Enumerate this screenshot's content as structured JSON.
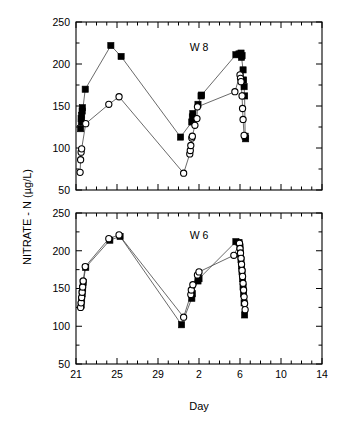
{
  "figure": {
    "yaxis_title": "NITRATE - N (µg/L)",
    "xaxis_title": "Day"
  },
  "chart_data": [
    {
      "type": "line",
      "panel_id": "top",
      "title": "W 8",
      "xlabel": "",
      "ylabel": "NITRATE - N (µg/L)",
      "xlim": [
        21,
        14
      ],
      "ylim": [
        50,
        250
      ],
      "yticks": [
        50,
        100,
        150,
        200,
        250
      ],
      "xticks": [
        21,
        25,
        29,
        2,
        6,
        10,
        14
      ],
      "xtick_minor_step": 1,
      "grid": false,
      "legend": "none",
      "series": [
        {
          "name": "filled-squares",
          "marker": "filled-square",
          "points": [
            [
              21.45,
              123
            ],
            [
              21.5,
              135
            ],
            [
              21.55,
              139
            ],
            [
              21.6,
              144
            ],
            [
              21.62,
              148
            ],
            [
              21.52,
              131
            ],
            [
              21.9,
              170
            ],
            [
              24.4,
              222
            ],
            [
              25.4,
              209
            ],
            [
              31.2,
              113
            ],
            [
              32.3,
              131
            ],
            [
              32.35,
              137
            ],
            [
              32.4,
              141
            ],
            [
              32.9,
              152
            ],
            [
              33.2,
              162
            ],
            [
              33.25,
              163
            ],
            [
              36.6,
              211
            ],
            [
              36.9,
              212
            ],
            [
              37.1,
              213
            ],
            [
              37.2,
              210
            ],
            [
              37.15,
              208
            ],
            [
              37.3,
              193
            ],
            [
              37.35,
              181
            ],
            [
              37.4,
              173
            ],
            [
              37.45,
              162
            ],
            [
              37.5,
              114
            ],
            [
              37.55,
              111
            ]
          ]
        },
        {
          "name": "open-circles",
          "marker": "open-circle",
          "points": [
            [
              21.4,
              71
            ],
            [
              21.45,
              86
            ],
            [
              21.5,
              95
            ],
            [
              21.55,
              99
            ],
            [
              21.95,
              129
            ],
            [
              24.2,
              152
            ],
            [
              25.2,
              161
            ],
            [
              31.5,
              70
            ],
            [
              32.1,
              93
            ],
            [
              32.15,
              97
            ],
            [
              32.2,
              103
            ],
            [
              32.3,
              112
            ],
            [
              32.35,
              114
            ],
            [
              32.6,
              127
            ],
            [
              32.8,
              135
            ],
            [
              32.85,
              149
            ],
            [
              36.5,
              167
            ],
            [
              37.0,
              187
            ],
            [
              37.05,
              183
            ],
            [
              37.1,
              179
            ],
            [
              37.2,
              162
            ],
            [
              37.25,
              147
            ],
            [
              37.3,
              134
            ],
            [
              37.4,
              115
            ]
          ]
        }
      ]
    },
    {
      "type": "line",
      "panel_id": "bottom",
      "title": "W 6",
      "xlabel": "Day",
      "ylabel": "NITRATE - N (µg/L)",
      "xlim": [
        21,
        14
      ],
      "ylim": [
        50,
        250
      ],
      "yticks": [
        50,
        100,
        150,
        200,
        250
      ],
      "xticks": [
        21,
        25,
        29,
        2,
        6,
        10,
        14
      ],
      "xtick_minor_step": 1,
      "grid": false,
      "legend": "none",
      "series": [
        {
          "name": "filled-squares",
          "marker": "filled-square",
          "points": [
            [
              21.5,
              128
            ],
            [
              21.55,
              135
            ],
            [
              21.6,
              143
            ],
            [
              21.65,
              150
            ],
            [
              21.7,
              158
            ],
            [
              21.95,
              178
            ],
            [
              24.3,
              214
            ],
            [
              25.3,
              219
            ],
            [
              31.3,
              102
            ],
            [
              32.3,
              137
            ],
            [
              32.35,
              143
            ],
            [
              32.9,
              160
            ],
            [
              33.0,
              163
            ],
            [
              36.6,
              212
            ],
            [
              36.9,
              211
            ],
            [
              37.0,
              205
            ],
            [
              37.05,
              196
            ],
            [
              37.1,
              188
            ],
            [
              37.15,
              180
            ],
            [
              37.2,
              172
            ],
            [
              37.25,
              163
            ],
            [
              37.3,
              152
            ],
            [
              37.35,
              143
            ],
            [
              37.4,
              131
            ],
            [
              37.45,
              115
            ]
          ]
        },
        {
          "name": "open-circles",
          "marker": "open-circle",
          "points": [
            [
              21.45,
              125
            ],
            [
              21.5,
              131
            ],
            [
              21.55,
              138
            ],
            [
              21.6,
              145
            ],
            [
              21.65,
              152
            ],
            [
              21.7,
              160
            ],
            [
              21.9,
              179
            ],
            [
              24.2,
              216
            ],
            [
              25.2,
              221
            ],
            [
              31.5,
              112
            ],
            [
              32.2,
              142
            ],
            [
              32.25,
              148
            ],
            [
              32.4,
              155
            ],
            [
              32.85,
              168
            ],
            [
              33.0,
              172
            ],
            [
              36.4,
              194
            ],
            [
              36.95,
              210
            ],
            [
              37.0,
              203
            ],
            [
              37.05,
              197
            ],
            [
              37.1,
              190
            ],
            [
              37.15,
              182
            ],
            [
              37.2,
              174
            ],
            [
              37.25,
              166
            ],
            [
              37.3,
              157
            ],
            [
              37.35,
              148
            ],
            [
              37.4,
              139
            ],
            [
              37.45,
              130
            ],
            [
              37.5,
              122
            ]
          ]
        }
      ]
    }
  ]
}
